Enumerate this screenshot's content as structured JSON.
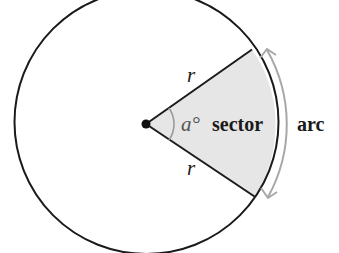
{
  "diagram": {
    "type": "circle-sector",
    "labels": {
      "radius_top": "r",
      "radius_bottom": "r",
      "angle": "a°",
      "sector": "sector",
      "arc": "arc"
    },
    "colors": {
      "stroke": "#1a1a1a",
      "sector_fill": "#e6e6e6",
      "angle_mark": "#9a9a9a",
      "arc_arrow": "#a8a8a8",
      "background": "#ffffff"
    },
    "geometry": {
      "center": [
        146,
        124
      ],
      "radius": 132,
      "sector_start_point": [
        252,
        50
      ],
      "sector_end_point": [
        254,
        196
      ]
    }
  }
}
